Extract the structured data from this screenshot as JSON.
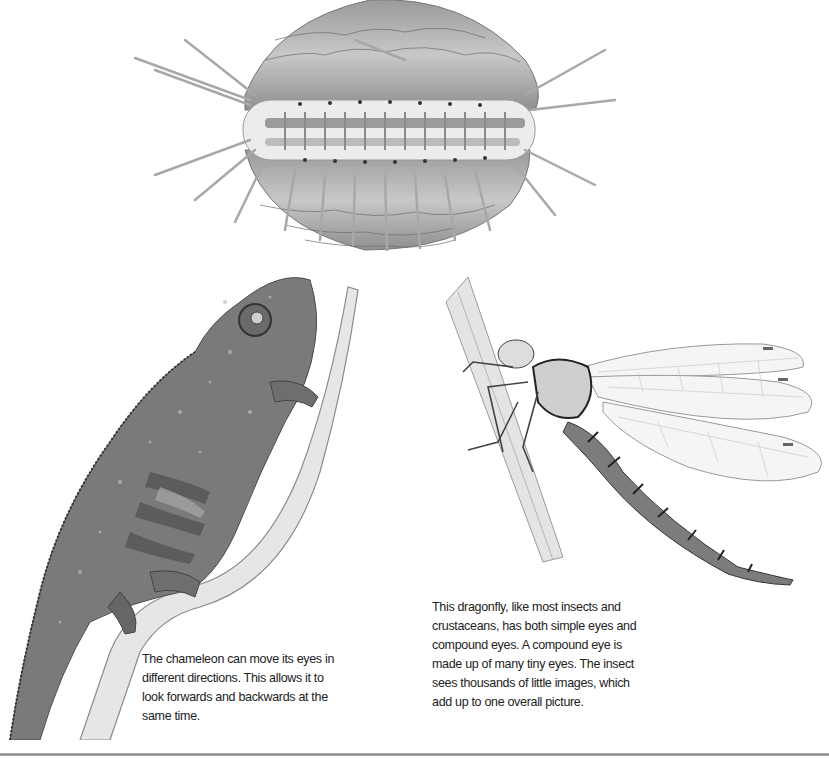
{
  "page": {
    "background": "#ffffff",
    "divider_color": "#999999"
  },
  "illustrations": [
    {
      "id": "scallop",
      "subject": "scallop with rows of eyes along mantle edge",
      "style": "grayscale pencil"
    },
    {
      "id": "chameleon",
      "subject": "chameleon climbing a branch",
      "style": "grayscale pencil"
    },
    {
      "id": "dragonfly",
      "subject": "dragonfly resting on a reed stem",
      "style": "grayscale pencil"
    }
  ],
  "captions": {
    "chameleon": {
      "lines": [
        "The chameleon can move its eyes in",
        "different directions. This allows it to",
        "look forwards and backwards at the",
        "same time."
      ]
    },
    "dragonfly": {
      "lines": [
        "This dragonfly, like most insects and",
        "crustaceans, has both simple eyes and",
        "compound eyes. A compound eye is",
        "made up of many tiny eyes. The insect",
        "sees thousands of little images, which",
        "add up to one overall picture."
      ]
    }
  }
}
